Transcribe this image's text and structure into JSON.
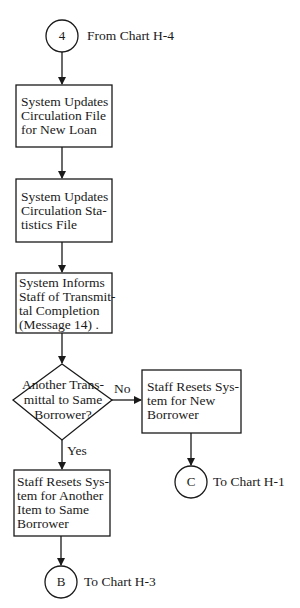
{
  "diagram": {
    "type": "flowchart",
    "style": {
      "line_color": "#1a1a1a",
      "background": "#ffffff"
    },
    "connectors": {
      "start": {
        "symbol": "4",
        "label": "From Chart H-4"
      },
      "end_c": {
        "symbol": "C",
        "label": "To Chart H-1"
      },
      "end_b": {
        "symbol": "B",
        "label": "To Chart H-3"
      }
    },
    "steps": [
      {
        "id": "update-circulation",
        "text": "System Updates\nCirculation File\nfor New Loan"
      },
      {
        "id": "update-statistics",
        "text": "System Updates\nCirculation Sta-\ntistics File"
      },
      {
        "id": "inform-staff",
        "text": "System Informs\nStaff of Transmit-\ntal Completion\n(Message 14) ."
      }
    ],
    "decision": {
      "text": "Another Trans-\nmittal to Same\nBorrower?",
      "no_label": "No",
      "yes_label": "Yes"
    },
    "branch_no": {
      "text": "Staff Resets Sys-\ntem for New\nBorrower"
    },
    "branch_yes": {
      "text": "Staff Resets Sys-\ntem for Another\nItem to Same\nBorrower"
    }
  }
}
